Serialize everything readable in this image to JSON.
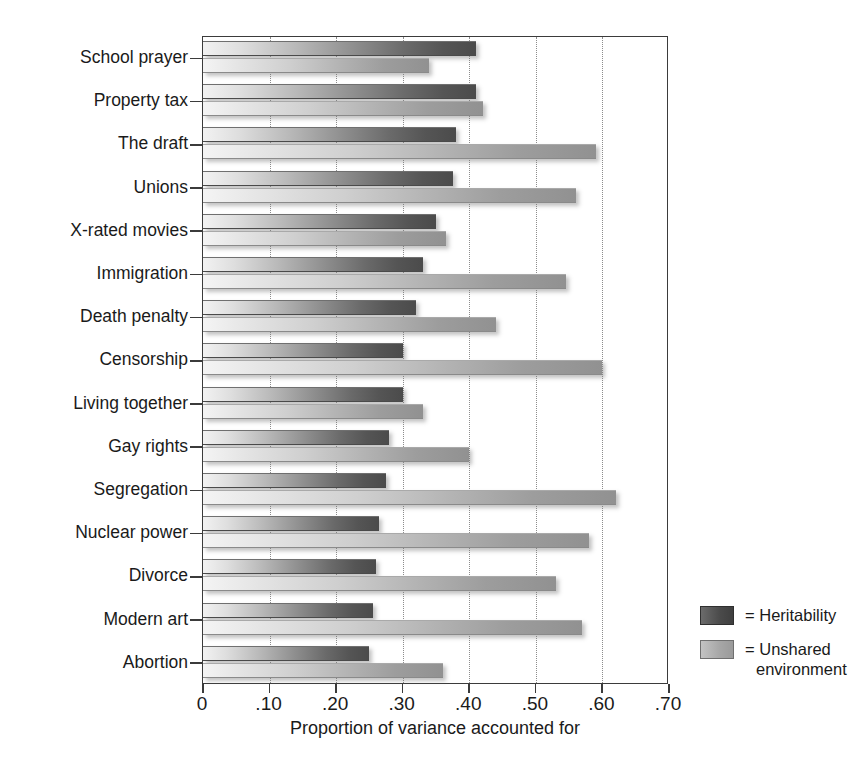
{
  "chart_data": {
    "type": "bar",
    "orientation": "horizontal",
    "title": "",
    "xlabel": "Proportion of variance accounted for",
    "ylabel": "",
    "xlim": [
      0,
      0.7
    ],
    "xticks": [
      0,
      0.1,
      0.2,
      0.3,
      0.4,
      0.5,
      0.6,
      0.7
    ],
    "xtick_labels": [
      "0",
      ".10",
      ".20",
      ".30",
      ".40",
      ".50",
      ".60",
      ".70"
    ],
    "grid": "vertical dotted gridlines at every .10",
    "legend_position": "right-bottom, outside plot",
    "categories": [
      "School prayer",
      "Property tax",
      "The draft",
      "Unions",
      "X-rated movies",
      "Immigration",
      "Death penalty",
      "Censorship",
      "Living together",
      "Gay rights",
      "Segregation",
      "Nuclear power",
      "Divorce",
      "Modern art",
      "Abortion"
    ],
    "series": [
      {
        "name": "Heritability",
        "color": "#4a4a4a",
        "values": [
          0.41,
          0.41,
          0.38,
          0.375,
          0.35,
          0.33,
          0.32,
          0.3,
          0.3,
          0.28,
          0.275,
          0.265,
          0.26,
          0.255,
          0.25
        ]
      },
      {
        "name": "Unshared environment",
        "color": "#a6a6a6",
        "values": [
          0.34,
          0.42,
          0.59,
          0.56,
          0.365,
          0.545,
          0.44,
          0.6,
          0.33,
          0.4,
          0.62,
          0.58,
          0.53,
          0.57,
          0.36
        ]
      }
    ]
  },
  "legend": {
    "items": [
      {
        "prefix": "= Heritability",
        "line2": ""
      },
      {
        "prefix": "= Unshared",
        "line2": "environment"
      }
    ]
  },
  "axis": {
    "x_title": "Proportion of variance accounted for"
  }
}
